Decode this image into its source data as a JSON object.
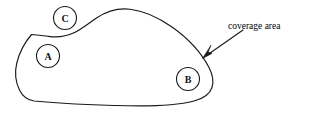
{
  "figure": {
    "background_color": "#ffffff",
    "ink_color": "#1a1a1a",
    "width": 314,
    "height": 118
  },
  "region": {
    "name": "coverage area",
    "shape": "irregular closed blob",
    "fill_color": "#ffffff",
    "stroke_color": "#1a1a1a"
  },
  "nodes": [
    {
      "id": "C",
      "label": "C",
      "cx": 65,
      "cy": 18,
      "r": 11.5,
      "position": "upper-left, on boundary"
    },
    {
      "id": "A",
      "label": "A",
      "cx": 48,
      "cy": 56,
      "r": 11.5,
      "position": "inside, left"
    },
    {
      "id": "B",
      "label": "B",
      "cx": 188,
      "cy": 79,
      "r": 11.5,
      "position": "inside, lower-right"
    }
  ],
  "callout": {
    "text": "coverage area",
    "text_x": 228,
    "text_y": 16,
    "arrow_from_x": 243,
    "arrow_from_y": 30,
    "arrow_to_x": 203,
    "arrow_to_y": 58
  }
}
